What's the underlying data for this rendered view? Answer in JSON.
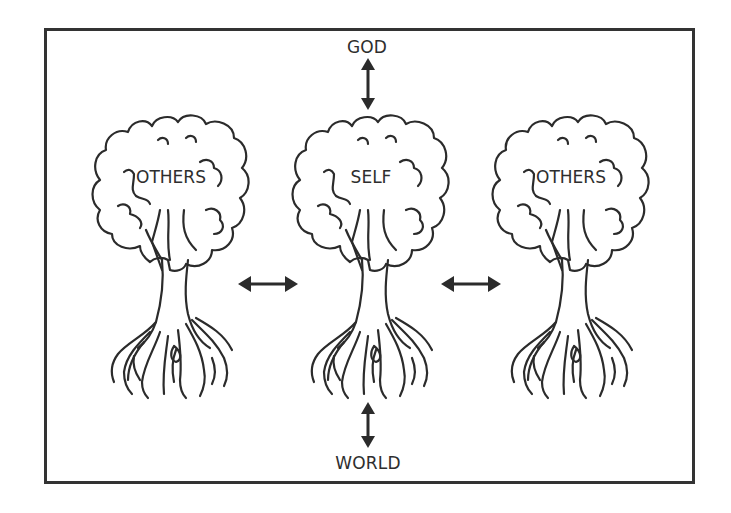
{
  "diagram": {
    "top_label": "GOD",
    "bottom_label": "WORLD",
    "trees": [
      {
        "label": "OTHERS",
        "position": "left"
      },
      {
        "label": "SELF",
        "position": "center"
      },
      {
        "label": "OTHERS",
        "position": "right"
      }
    ],
    "arrows": [
      {
        "from": "SELF",
        "to": "GOD",
        "type": "bidirectional-vertical"
      },
      {
        "from": "SELF",
        "to": "WORLD",
        "type": "bidirectional-vertical"
      },
      {
        "from": "OTHERS (left)",
        "to": "SELF",
        "type": "bidirectional-horizontal"
      },
      {
        "from": "SELF",
        "to": "OTHERS (right)",
        "type": "bidirectional-horizontal"
      }
    ],
    "colors": {
      "stroke": "#2b2b2b",
      "background": "#ffffff"
    }
  }
}
